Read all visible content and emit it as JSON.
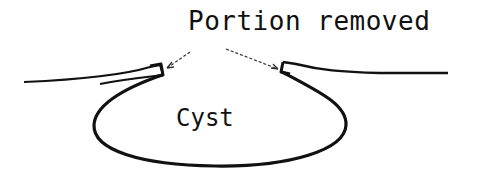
{
  "diagram": {
    "labels": {
      "portion_removed": "Portion removed",
      "cyst": "Cyst"
    },
    "colors": {
      "stroke": "#111111",
      "background": "#ffffff"
    },
    "arrows": [
      {
        "from": "portion_removed",
        "to": "left-cut-edge"
      },
      {
        "from": "portion_removed",
        "to": "right-cut-edge"
      }
    ]
  }
}
